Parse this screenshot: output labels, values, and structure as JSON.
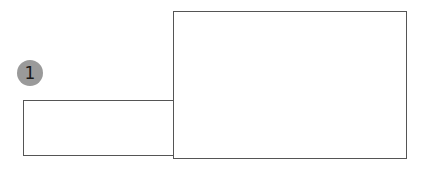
{
  "diagram": {
    "badge": {
      "label": "1",
      "color": "#9a9a9a",
      "text_color": "#1a1a1a"
    },
    "shapes": [
      {
        "id": "small-rect",
        "x": 23,
        "y": 100,
        "width": 151,
        "height": 56,
        "stroke": "#555555"
      },
      {
        "id": "large-rect",
        "x": 173,
        "y": 11,
        "width": 234,
        "height": 148,
        "stroke": "#555555"
      }
    ]
  }
}
